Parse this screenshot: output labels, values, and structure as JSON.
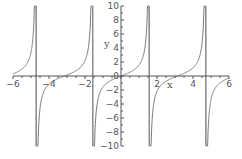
{
  "chart_data": {
    "type": "line",
    "title": "",
    "function": "tan(x)",
    "xlabel": "x",
    "ylabel": "y",
    "xlim": [
      -6,
      6
    ],
    "ylim": [
      -10,
      10
    ],
    "grid": false,
    "legend": null,
    "x_ticks": [
      -6,
      -4,
      -2,
      2,
      4,
      6
    ],
    "x_tick_labels": [
      "−6",
      "−4",
      "−2",
      "2",
      "4",
      "6"
    ],
    "y_ticks": [
      -10,
      -8,
      -6,
      -4,
      -2,
      0,
      2,
      4,
      6,
      8,
      10
    ],
    "y_tick_labels": [
      "−10",
      "−8",
      "−6",
      "−4",
      "−2",
      "0",
      "2",
      "4",
      "6",
      "8",
      "10"
    ],
    "asymptotes": [
      -4.712,
      -1.571,
      1.571,
      4.712
    ],
    "series": [
      {
        "name": "tan(x)",
        "color": "#777777",
        "x": [
          -6,
          -5.5,
          -5,
          -4.8,
          -4.75,
          -4.65,
          -4.6,
          -4.5,
          -4,
          -3.5,
          -3,
          -2.5,
          -2,
          -1.7,
          -1.65,
          -1.5,
          -1.4,
          -1.2,
          -1,
          -0.5,
          0,
          0.5,
          1,
          1.2,
          1.4,
          1.5,
          1.65,
          1.7,
          2,
          2.5,
          3,
          3.5,
          4,
          4.5,
          4.6,
          4.65,
          4.75,
          4.8,
          5,
          5.5,
          6
        ],
        "y": [
          0.29,
          0.99,
          3.38,
          11.4,
          26.4,
          -16.3,
          -8.86,
          -4.64,
          -1.16,
          -0.37,
          0.14,
          0.75,
          2.19,
          7.7,
          12.4,
          -14.1,
          -5.8,
          -2.57,
          -1.56,
          -0.55,
          0,
          0.55,
          1.56,
          2.57,
          5.8,
          14.1,
          -12.4,
          -7.7,
          -2.19,
          -0.75,
          -0.14,
          0.37,
          1.16,
          4.64,
          8.86,
          16.3,
          -26.4,
          -11.4,
          -3.38,
          -0.99,
          -0.29
        ]
      }
    ]
  }
}
